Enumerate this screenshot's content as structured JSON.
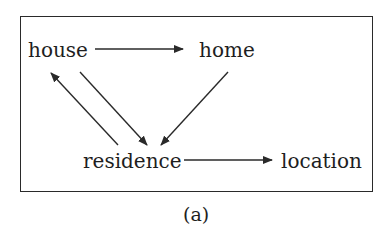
{
  "diagram": {
    "nodes": [
      {
        "id": "house",
        "label": "house"
      },
      {
        "id": "home",
        "label": "home"
      },
      {
        "id": "residence",
        "label": "residence"
      },
      {
        "id": "location",
        "label": "location"
      }
    ],
    "edges": [
      {
        "from": "house",
        "to": "home"
      },
      {
        "from": "house",
        "to": "residence"
      },
      {
        "from": "residence",
        "to": "house"
      },
      {
        "from": "home",
        "to": "residence"
      },
      {
        "from": "residence",
        "to": "location"
      }
    ],
    "caption": "(a)",
    "colors": {
      "ink": "#1e1e1e",
      "background": "#ffffff"
    }
  }
}
